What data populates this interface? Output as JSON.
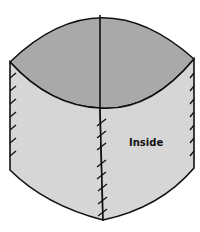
{
  "diagram": {
    "label": "Inside",
    "colors": {
      "top_fill": "#a9a9a9",
      "side_fill": "#d6d6d6",
      "stroke": "#111111",
      "background": "#ffffff"
    }
  }
}
